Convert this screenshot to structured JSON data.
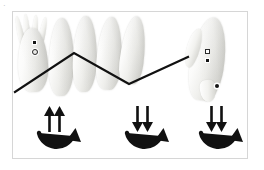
{
  "figure": {
    "corner_mark": "·",
    "background_color": "#ffffff",
    "frame_color": "#d6d6d6",
    "ink_color": "#111111"
  },
  "panel": {
    "label": "specimen-motion-panel"
  },
  "specimen_group_left": {
    "name": "left-specimen-cluster",
    "count": 5,
    "items": [
      {
        "id": "specimen-1",
        "alt": "pale elongated specimen with splayed arms"
      },
      {
        "id": "specimen-2",
        "alt": "pale elongated specimen"
      },
      {
        "id": "specimen-3",
        "alt": "pale elongated specimen"
      },
      {
        "id": "specimen-4",
        "alt": "pale elongated specimen"
      },
      {
        "id": "specimen-5",
        "alt": "pale elongated specimen, tapered"
      }
    ],
    "markers": [
      {
        "id": "marker-filled-square-left",
        "shape": "filled-square"
      },
      {
        "id": "marker-open-circle-left",
        "shape": "open-circle"
      }
    ]
  },
  "specimen_group_right": {
    "name": "right-specimen",
    "count": 1,
    "items": [
      {
        "id": "specimen-6",
        "alt": "pale elongated specimen, rotated, with fin"
      }
    ],
    "markers": [
      {
        "id": "marker-open-square-right",
        "shape": "open-square"
      },
      {
        "id": "marker-filled-square-right",
        "shape": "filled-square"
      },
      {
        "id": "marker-filled-dot-right",
        "shape": "filled-dot"
      }
    ]
  },
  "chevron": {
    "name": "zigzag-trace-line",
    "color": "#111111",
    "stroke_width": 2.2,
    "points": "2,80 61,41 116,72 175,45"
  },
  "motion_symbols": [
    {
      "id": "motion-symbol-1",
      "arrow_direction": "up",
      "arrow_count": 2,
      "arc": "u-arc-with-arrowhead",
      "glyph": "↑↑"
    },
    {
      "id": "motion-symbol-2",
      "arrow_direction": "down",
      "arrow_count": 2,
      "arc": "u-arc-with-arrowhead",
      "glyph": "↓↓"
    },
    {
      "id": "motion-symbol-3",
      "arrow_direction": "down",
      "arrow_count": 2,
      "arc": "u-arc-with-arrowhead",
      "glyph": "↓↓"
    }
  ]
}
